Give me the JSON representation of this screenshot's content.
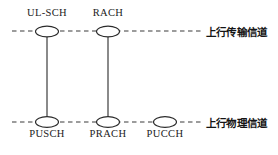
{
  "diagram": {
    "title_present": false,
    "colors": {
      "background": "#ffffff",
      "stroke": "#2a2a2a",
      "dashed_line": "#3a3a3a",
      "text": "#1b1b1b"
    },
    "layers": [
      {
        "id": "transport",
        "label": "上行传输信道",
        "y": 31,
        "label_x": 206,
        "label_y": 24
      },
      {
        "id": "physical",
        "label": "上行物理信道",
        "y": 122,
        "label_x": 206,
        "label_y": 115
      }
    ],
    "nodes": [
      {
        "id": "ul-sch",
        "label": "UL-SCH",
        "layer": "transport",
        "cx": 47,
        "cy": 31,
        "rx": 11.5,
        "ry": 5.5,
        "label_position": "above",
        "label_x": 47,
        "label_y": 9
      },
      {
        "id": "rach",
        "label": "RACH",
        "layer": "transport",
        "cx": 108,
        "cy": 31,
        "rx": 11.5,
        "ry": 5.5,
        "label_position": "above",
        "label_x": 108,
        "label_y": 9
      },
      {
        "id": "pusch",
        "label": "PUSCH",
        "layer": "physical",
        "cx": 47,
        "cy": 122,
        "rx": 11.5,
        "ry": 5.5,
        "label_position": "below",
        "label_x": 47,
        "label_y": 129
      },
      {
        "id": "prach",
        "label": "PRACH",
        "layer": "physical",
        "cx": 108,
        "cy": 122,
        "rx": 11.5,
        "ry": 5.5,
        "label_position": "below",
        "label_x": 108,
        "label_y": 129
      },
      {
        "id": "pucch",
        "label": "PUCCH",
        "layer": "physical",
        "cx": 165,
        "cy": 122,
        "rx": 11.5,
        "ry": 5.5,
        "label_position": "below",
        "label_x": 165,
        "label_y": 129
      }
    ],
    "connections": [
      {
        "id": "ul-sch-to-pusch",
        "from": "ul-sch",
        "to": "pusch",
        "x": 47,
        "y1": 37,
        "y2": 117
      },
      {
        "id": "rach-to-prach",
        "from": "rach",
        "to": "prach",
        "x": 108,
        "y1": 37,
        "y2": 117
      }
    ],
    "guide_lines": [
      {
        "id": "transport-guide",
        "y": 31,
        "x1": 12,
        "x2": 202
      },
      {
        "id": "physical-guide",
        "y": 122,
        "x1": 12,
        "x2": 202
      }
    ]
  }
}
